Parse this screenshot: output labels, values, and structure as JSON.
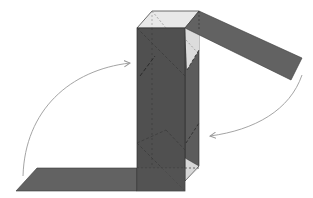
{
  "diagram": {
    "colors": {
      "background": "#ffffff",
      "box_front": "#505050",
      "box_side": "#5c5c5c",
      "box_top": "#e8e8e8",
      "light_triangle": "#dcdcdc",
      "strip": "#626262",
      "edge": "#2e2e2e",
      "dashed": "#3a3a3a",
      "dashed_light": "#8a8a8a",
      "arrow": "#9a9a9a"
    },
    "elements": [
      {
        "name": "box",
        "type": "rectangular-prism"
      },
      {
        "name": "bottom-strip",
        "type": "flap",
        "position": "bottom-left"
      },
      {
        "name": "top-strip",
        "type": "flap",
        "position": "top-right"
      },
      {
        "name": "left-arrow",
        "type": "curved-arrow",
        "direction": "up-right"
      },
      {
        "name": "right-arrow",
        "type": "curved-arrow",
        "direction": "down-left"
      }
    ]
  }
}
